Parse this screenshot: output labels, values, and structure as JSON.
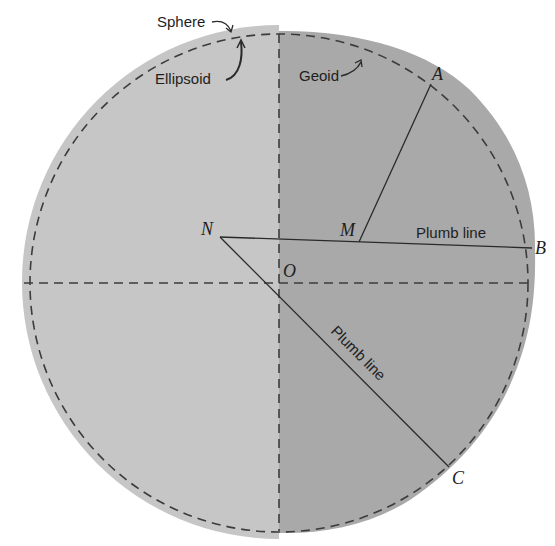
{
  "figure": {
    "colors": {
      "background": "#ffffff",
      "sphere_fill": "#c6c6c6",
      "geoid_fill": "#a9a9a9",
      "line": "#2a2a2a",
      "dash": "#3c3c3c"
    },
    "labels": {
      "sphere": "Sphere",
      "ellipsoid": "Ellipsoid",
      "geoid": "Geoid",
      "plumb_line_horizontal": "Plumb line",
      "plumb_line_diagonal": "Plumb line"
    },
    "points": {
      "A": "A",
      "B": "B",
      "C": "C",
      "M": "M",
      "N": "N",
      "O": "O"
    }
  }
}
